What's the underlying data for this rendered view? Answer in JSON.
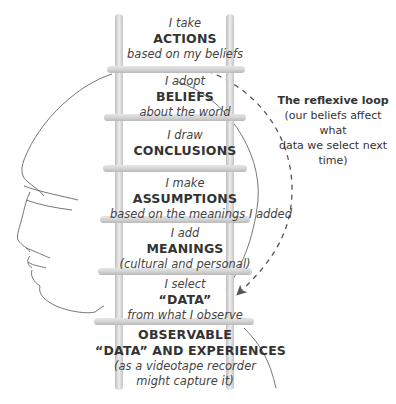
{
  "diagram": {
    "steps": [
      {
        "pre": "I take",
        "label": "ACTIONS",
        "post": "based on my beliefs"
      },
      {
        "pre": "I adopt",
        "label": "BELIEFS",
        "post": "about the world"
      },
      {
        "pre": "I draw",
        "label": "CONCLUSIONS",
        "post": ""
      },
      {
        "pre": "I make",
        "label": "ASSUMPTIONS",
        "post": "based on the meanings I added"
      },
      {
        "pre": "I add",
        "label": "MEANINGS",
        "post": "(cultural and personal)"
      },
      {
        "pre": "I select",
        "label": "“DATA”",
        "post": "from what I observe"
      },
      {
        "pre": "",
        "label": "OBSERVABLE",
        "label2": "“DATA” AND EXPERIENCES",
        "post": "(as a videotape recorder",
        "post2": "might capture it)"
      }
    ],
    "loop": {
      "title": "The reflexive loop",
      "line1": "(our beliefs affect what",
      "line2": "data we select next time)"
    },
    "colors": {
      "rail": "#d9d9d9",
      "rail_shade": "#b5b5b5",
      "text": "#3a3a3a",
      "line": "#555555"
    }
  }
}
